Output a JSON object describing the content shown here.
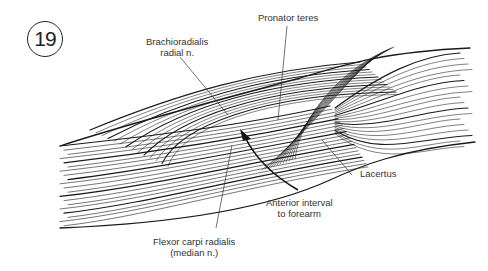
{
  "figure": {
    "number": "19",
    "labels": {
      "brachioradialis": [
        "Brachioradialis",
        "radial n."
      ],
      "pronator_teres": "Pronator teres",
      "lacertus": "Lacertus",
      "anterior_interval": [
        "Anterior interval",
        "to forearm"
      ],
      "flexor_carpi_radialis": [
        "Flexor carpi radialis",
        "(median n.)"
      ]
    },
    "colors": {
      "ink": "#1a1a1a",
      "label_text": "#333333",
      "background": "#ffffff"
    }
  }
}
